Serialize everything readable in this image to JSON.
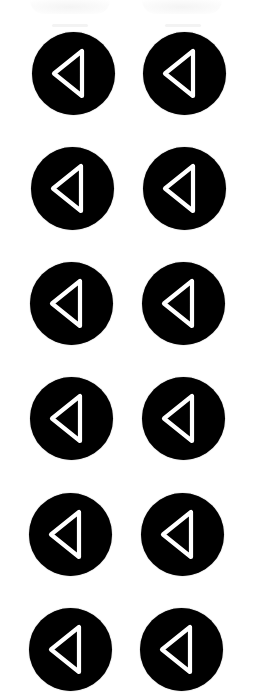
{
  "page": {
    "background": "#ffffff"
  },
  "icon_style": {
    "circle_color": "#000000",
    "glyph_color": "#ffffff",
    "glyph": "left-pointing outlined triangle (back / previous)"
  },
  "buttons": [
    {
      "row": 1,
      "col": 1,
      "icon": "back-triangle-icon",
      "label": "Back"
    },
    {
      "row": 1,
      "col": 2,
      "icon": "back-triangle-icon",
      "label": "Back"
    },
    {
      "row": 2,
      "col": 1,
      "icon": "back-triangle-icon",
      "label": "Back"
    },
    {
      "row": 2,
      "col": 2,
      "icon": "back-triangle-icon",
      "label": "Back"
    },
    {
      "row": 3,
      "col": 1,
      "icon": "back-triangle-icon",
      "label": "Back"
    },
    {
      "row": 3,
      "col": 2,
      "icon": "back-triangle-icon",
      "label": "Back"
    },
    {
      "row": 4,
      "col": 1,
      "icon": "back-triangle-icon",
      "label": "Back"
    },
    {
      "row": 4,
      "col": 2,
      "icon": "back-triangle-icon",
      "label": "Back"
    },
    {
      "row": 5,
      "col": 1,
      "icon": "back-triangle-icon",
      "label": "Back"
    },
    {
      "row": 5,
      "col": 2,
      "icon": "back-triangle-icon",
      "label": "Back"
    },
    {
      "row": 6,
      "col": 1,
      "icon": "back-triangle-icon",
      "label": "Back"
    },
    {
      "row": 6,
      "col": 2,
      "icon": "back-triangle-icon",
      "label": "Back"
    }
  ]
}
